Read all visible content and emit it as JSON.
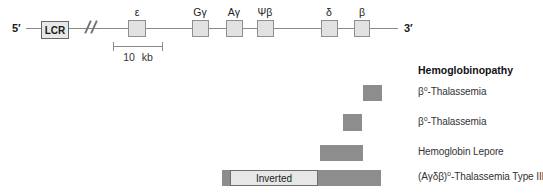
{
  "diagram": {
    "five_prime_label": "5′",
    "three_prime_label": "3′",
    "lcr_label": "LCR",
    "genes": [
      {
        "name": "epsilon",
        "label": "ε"
      },
      {
        "name": "g-gamma",
        "label": "Gγ"
      },
      {
        "name": "a-gamma",
        "label": "Aγ"
      },
      {
        "name": "psi-beta",
        "label": "Ψβ"
      },
      {
        "name": "delta",
        "label": "δ"
      },
      {
        "name": "beta",
        "label": "β"
      }
    ],
    "scale_bar_label": "10 kb"
  },
  "legend": {
    "header": "Hemoglobinopathy",
    "rows": [
      {
        "label": "β⁰-Thalassemia"
      },
      {
        "label": "β⁰-Thalassemia"
      },
      {
        "label": "Hemoglobin Lepore"
      },
      {
        "label": "(Aγδβ)⁰-Thalassemia Type III",
        "bar_label": "Inverted"
      }
    ]
  },
  "colors": {
    "deletion_bar": "#8d8d8d",
    "gene_box_fill": "#e2e2e2",
    "gene_box_border": "#8f8f8f",
    "line": "#8a8a8a",
    "text": "#222222",
    "background": "#ffffff"
  }
}
